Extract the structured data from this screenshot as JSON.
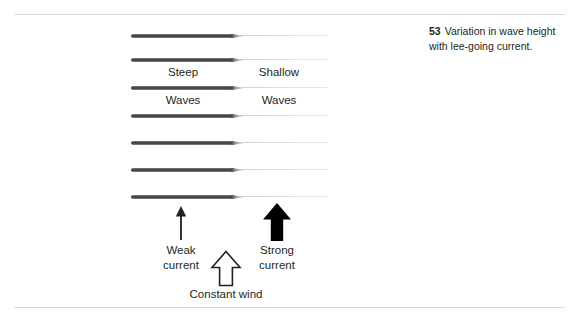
{
  "figure": {
    "wave_rows": [
      {
        "id": "wave-0"
      },
      {
        "id": "wave-1"
      },
      {
        "id": "wave-2"
      },
      {
        "id": "wave-3"
      },
      {
        "id": "wave-4"
      },
      {
        "id": "wave-5"
      },
      {
        "id": "wave-6"
      }
    ],
    "labels": {
      "steep": "Steep",
      "shallow": "Shallow",
      "waves_left": "Waves",
      "waves_right": "Waves"
    },
    "arrows": {
      "weak": {
        "icon": "thin-up-arrow-icon",
        "caption": "Weak\ncurrent"
      },
      "strong": {
        "icon": "thick-up-arrow-icon",
        "caption": "Strong\ncurrent"
      },
      "wind": {
        "icon": "hollow-up-arrow-icon",
        "caption": "Constant wind"
      }
    }
  },
  "caption": {
    "number": "53",
    "text": "Variation in wave height with lee-going current."
  },
  "colors": {
    "wave_dark": "#3a3a3e",
    "wave_light": "#e0e0e4",
    "rule": "#d9d9dc",
    "text": "#231f20",
    "page_background": "#ffffff"
  }
}
